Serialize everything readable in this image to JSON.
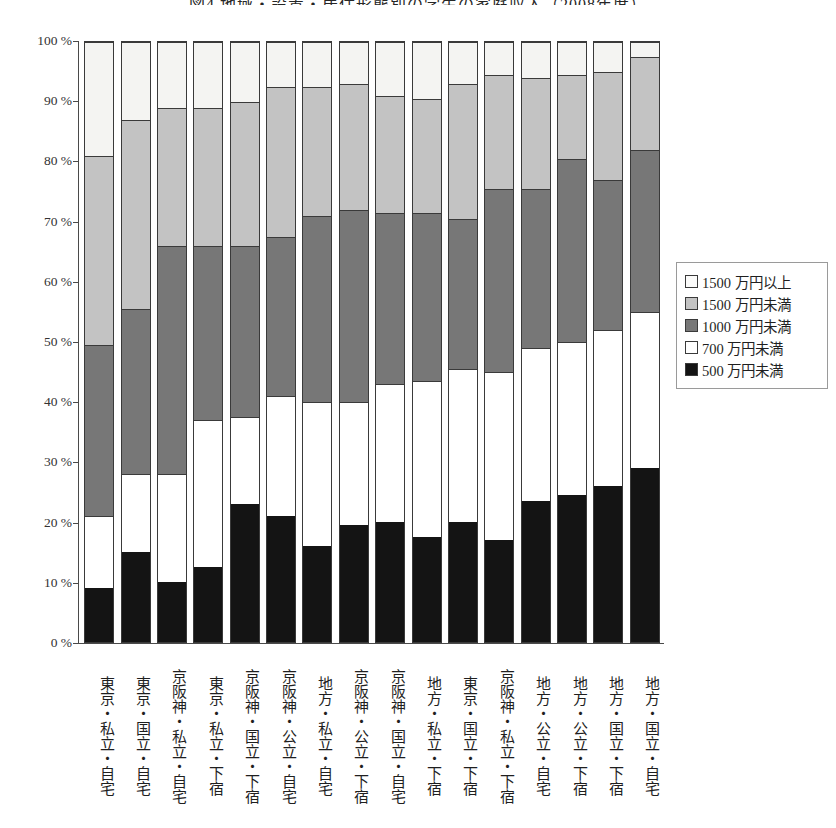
{
  "title": "図4 地域・設置・居住形態別の学生の家庭収入（2008年度）",
  "legend": {
    "position": "right",
    "items": [
      {
        "label": "1500 万円以上",
        "key": "over1500",
        "color": "#f4f4f2"
      },
      {
        "label": "1500 万円未満",
        "key": "under1500",
        "color": "#c3c3c3"
      },
      {
        "label": "1000 万円未満",
        "key": "under1000",
        "color": "#777777"
      },
      {
        "label": "700 万円未満",
        "key": "under700",
        "color": "#ffffff"
      },
      {
        "label": "500 万円未満",
        "key": "under500",
        "color": "#141414"
      }
    ]
  },
  "yaxis": {
    "label": "",
    "ticks": [
      "0 %",
      "10 %",
      "20 %",
      "30 %",
      "40 %",
      "50 %",
      "60 %",
      "70 %",
      "80 %",
      "90 %",
      "100 %"
    ],
    "min": 0,
    "max": 100
  },
  "chart_data": {
    "type": "bar",
    "subtype": "stacked-percent",
    "title": "図4 地域・設置・居住形態別の学生の家庭収入（2008年度）",
    "xlabel": "",
    "ylabel": "",
    "ylim": [
      0,
      100
    ],
    "grid": false,
    "legend_position": "right",
    "categories": [
      "東京・私立・自宅",
      "東京・国立・自宅",
      "京阪神・私立・自宅",
      "東京・私立・下宿",
      "京阪神・国立・下宿",
      "京阪神・公立・自宅",
      "地方・私立・自宅",
      "京阪神・公立・下宿",
      "京阪神・国立・自宅",
      "地方・私立・下宿",
      "東京・国立・下宿",
      "京阪神・私立・下宿",
      "地方・公立・自宅",
      "地方・公立・下宿",
      "地方・国立・下宿",
      "地方・国立・自宅"
    ],
    "series": [
      {
        "name": "500 万円未満",
        "color": "#141414",
        "values": [
          9.0,
          15.0,
          10.0,
          12.5,
          23.0,
          21.0,
          16.0,
          19.5,
          20.0,
          17.5,
          20.0,
          17.0,
          23.5,
          24.5,
          26.0,
          29.0
        ]
      },
      {
        "name": "700 万円未満",
        "color": "#ffffff",
        "values": [
          12.0,
          13.0,
          18.0,
          24.5,
          14.5,
          20.0,
          24.0,
          20.5,
          23.0,
          26.0,
          25.5,
          28.0,
          25.5,
          25.5,
          26.0,
          26.0
        ]
      },
      {
        "name": "1000 万円未満",
        "color": "#777777",
        "values": [
          28.5,
          27.5,
          38.0,
          29.0,
          28.5,
          26.5,
          31.0,
          32.0,
          28.5,
          28.0,
          25.0,
          30.5,
          26.5,
          30.5,
          25.0,
          27.0
        ]
      },
      {
        "name": "1500 万円未満",
        "color": "#c3c3c3",
        "values": [
          31.5,
          31.5,
          23.0,
          23.0,
          24.0,
          25.0,
          21.5,
          21.0,
          19.5,
          19.0,
          22.5,
          19.0,
          18.5,
          14.0,
          18.0,
          15.5
        ]
      },
      {
        "name": "1500 万円以上",
        "color": "#f4f4f2",
        "values": [
          19.0,
          13.0,
          11.0,
          11.0,
          10.0,
          7.5,
          7.5,
          7.0,
          9.0,
          9.5,
          7.0,
          5.5,
          6.0,
          5.5,
          5.0,
          2.5
        ]
      }
    ]
  }
}
